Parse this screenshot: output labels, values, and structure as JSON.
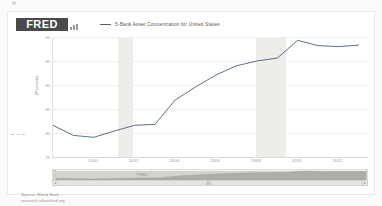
{
  "brand": {
    "logo_text": "FRED",
    "logo_mark_icon": "bar-chart-icon"
  },
  "legend": {
    "series_label": "5-Bank Asset Concentration for United States",
    "swatch_color": "#4d5f7a"
  },
  "footer": {
    "source_line": "Source: World Bank",
    "site_line": "research.stlouisfed.org"
  },
  "navigator": {
    "title": "FRED",
    "left_arrow": "◂",
    "right_arrow": "▸"
  },
  "chart_data": {
    "type": "line",
    "title": "",
    "xlabel": "",
    "ylabel": "(Percent)",
    "ylim": [
      25,
      50
    ],
    "yticks": [
      50,
      45,
      40,
      35,
      30,
      25
    ],
    "xlim": [
      1998,
      2013.5
    ],
    "xticks": [
      2000,
      2002,
      2004,
      2006,
      2008,
      2010,
      2012
    ],
    "grid": true,
    "legend_position": "top",
    "line_color": "#4d5f7a",
    "series": [
      {
        "name": "5-Bank Asset Concentration for United States",
        "x": [
          1998,
          1999,
          2000,
          2001,
          2002,
          2003,
          2004,
          2005,
          2006,
          2007,
          2008,
          2009,
          2010,
          2011,
          2012,
          2013
        ],
        "values": [
          31.6,
          29.5,
          29.1,
          30.4,
          31.6,
          31.8,
          36.9,
          39.6,
          42.1,
          44.0,
          45.0,
          45.6,
          49.3,
          48.2,
          48.0,
          48.3
        ]
      }
    ],
    "recession_bands": [
      {
        "start": 2001.2,
        "end": 2001.9
      },
      {
        "start": 2007.95,
        "end": 2009.45
      }
    ]
  }
}
